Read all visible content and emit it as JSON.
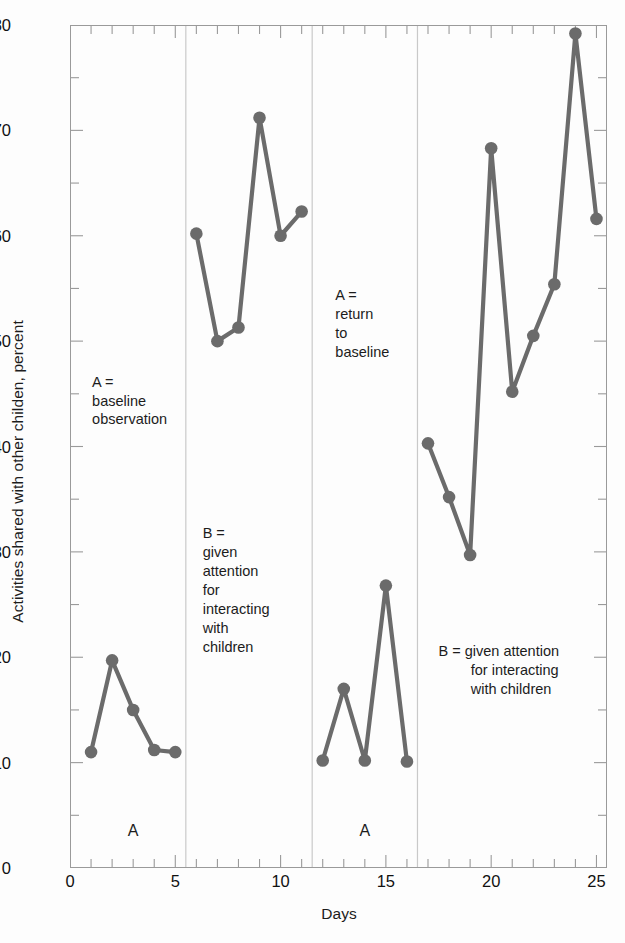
{
  "chart_data": {
    "type": "line",
    "title": "",
    "xlabel": "Days",
    "ylabel": "Activities shared with other childen, percent",
    "xlim": [
      0,
      25.5
    ],
    "ylim": [
      0,
      80
    ],
    "y_ticks": [
      0,
      10,
      20,
      30,
      40,
      50,
      60,
      70,
      80
    ],
    "y_tick_labels": [
      "0",
      "10",
      "20",
      "30",
      "40",
      "50",
      "60",
      "70",
      "80"
    ],
    "y_minor_tick_step": 5,
    "x_ticks": [
      0,
      5,
      10,
      15,
      20,
      25
    ],
    "x_tick_labels": [
      "0",
      "5",
      "10",
      "15",
      "20",
      "25"
    ],
    "x_minor_tick_step": 1,
    "grid": false,
    "legend": "none",
    "marker": "circle",
    "series": [
      {
        "name": "Activities shared with other children",
        "color": "#6b6b6b",
        "x": [
          1,
          2,
          3,
          4,
          5
        ],
        "values": [
          11.0,
          19.7,
          15.0,
          11.2,
          11.0
        ],
        "segment": "A1"
      },
      {
        "name": "Activities shared with other children",
        "color": "#6b6b6b",
        "x": [
          6,
          7,
          8,
          9,
          10,
          11
        ],
        "values": [
          60.2,
          50.0,
          51.3,
          71.2,
          60.0,
          62.3
        ],
        "segment": "B1"
      },
      {
        "name": "Activities shared with other children",
        "color": "#6b6b6b",
        "x": [
          12,
          13,
          14,
          15,
          16
        ],
        "values": [
          10.2,
          17.0,
          10.2,
          26.8,
          10.1
        ],
        "segment": "A2"
      },
      {
        "name": "Activities shared with other children",
        "color": "#6b6b6b",
        "x": [
          17,
          18,
          19,
          20,
          21,
          22,
          23,
          24,
          25
        ],
        "values": [
          40.3,
          35.2,
          29.7,
          68.3,
          45.2,
          50.5,
          55.4,
          79.2,
          61.6
        ],
        "segment": "B2"
      }
    ],
    "phase_dividers": [
      5.5,
      11.5,
      16.5
    ],
    "annotations": [
      {
        "id": "annot-a-baseline",
        "text": "A =\nbaseline\nobservation",
        "x": 1.05,
        "y": 47.0
      },
      {
        "id": "annot-b-given-attention",
        "text": "B =\ngiven\nattention\nfor\ninteracting\nwith\nchildren",
        "x": 6.3,
        "y": 32.6
      },
      {
        "id": "annot-a-return",
        "text": "A =\nreturn\nto\nbaseline",
        "x": 12.6,
        "y": 55.2
      },
      {
        "id": "annot-b-given-attention-2",
        "text": "B = given attention\n        for interacting\n        with children",
        "x": 17.5,
        "y": 21.4
      }
    ],
    "phase_labels": [
      {
        "id": "phase-label-a1",
        "text": "A",
        "x": 3.0,
        "y": 4.4
      },
      {
        "id": "phase-label-a2",
        "text": "A",
        "x": 14.0,
        "y": 4.4
      }
    ]
  },
  "style": {
    "marker_color": "#6b6b6b",
    "line_color": "#6b6b6b",
    "axis_color": "#9a9a9a",
    "tick_color": "#9a9a9a",
    "divider_color": "#c9c9c9",
    "text_color": "#1c1c1c",
    "background": "#fdfdfd"
  }
}
